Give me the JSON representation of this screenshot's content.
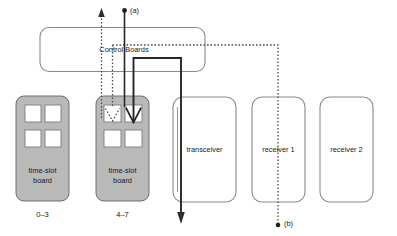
{
  "diagram": {
    "title_block": {
      "label": "Control Boards"
    },
    "time_slot_boards": [
      {
        "label_line1": "time-slot",
        "label_line2": "board",
        "range": "0–3",
        "slots": 4,
        "slot_arrows": []
      },
      {
        "label_line1": "time-slot",
        "label_line2": "board",
        "range": "4–7",
        "slots": 4,
        "slot_arrows": [
          "dotted-down",
          "solid-down"
        ]
      }
    ],
    "units": [
      {
        "label": "transceiver"
      },
      {
        "label": "receiver 1"
      },
      {
        "label": "receiver 2"
      }
    ],
    "port_labels": [
      {
        "id": "a",
        "label": "(a)"
      },
      {
        "id": "b",
        "label": "(b)"
      }
    ],
    "colors": {
      "board_fill": "#b9b9b9",
      "board_stroke": "#6e6e6e",
      "box_fill": "#ffffff",
      "box_stroke": "#8a8a8a",
      "slot_fill": "#ffffff",
      "solid_path": "#262626",
      "dotted_path": "#4a4a4a",
      "text": "#1a1a1a"
    }
  }
}
